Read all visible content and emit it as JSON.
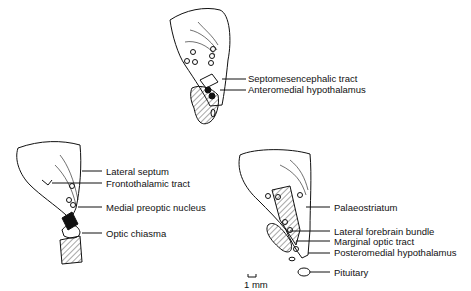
{
  "figure": {
    "top_section": {
      "labels": [
        "Septomesencephalic tract",
        "Anteromedial hypothalamus"
      ]
    },
    "left_section": {
      "labels": [
        "Lateral septum",
        "Frontothalamic tract",
        "Medial preoptic nucleus",
        "Optic chiasma"
      ]
    },
    "right_section": {
      "labels": [
        "Palaeostriatum",
        "Lateral forebrain bundle",
        "Marginal optic tract",
        "Posteromedial hypothalamus",
        "Pituitary"
      ]
    },
    "scale_bar": {
      "label": "1 mm"
    }
  }
}
